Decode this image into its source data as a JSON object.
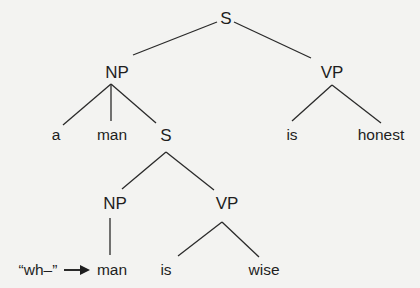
{
  "tree": {
    "root": {
      "label": "S"
    },
    "np": {
      "label": "NP"
    },
    "vp": {
      "label": "VP"
    },
    "np_children": [
      "a",
      "man",
      "S"
    ],
    "vp_children": [
      "is",
      "honest"
    ],
    "rel_clause": {
      "np": {
        "label": "NP"
      },
      "vp": {
        "label": "VP"
      },
      "np_child": "man",
      "vp_children": [
        "is",
        "wise"
      ]
    },
    "annotation": {
      "text": "“wh–”",
      "arrow": "right-arrow"
    }
  },
  "colors": {
    "background": "#f3f3f1",
    "ink": "#1e1e1e"
  }
}
